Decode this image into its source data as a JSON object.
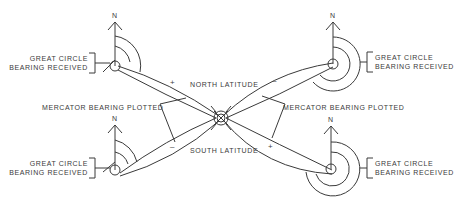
{
  "diagram": {
    "north_label": "N",
    "center_labels": {
      "north_latitude": "NORTH LATITUDE",
      "south_latitude": "SOUTH LATITUDE"
    },
    "mercator_labels": {
      "left": "MERCATOR BEARING PLOTTED",
      "right": "MERCATOR BEARING PLOTTED"
    },
    "stations": [
      {
        "position": "top-left",
        "line1": "GREAT CIRCLE",
        "line2": "BEARING RECEIVED"
      },
      {
        "position": "top-right",
        "line1": "GREAT CIRCLE",
        "line2": "BEARING RECEIVED"
      },
      {
        "position": "bottom-left",
        "line1": "GREAT CIRCLE",
        "line2": "BEARING RECEIVED"
      },
      {
        "position": "bottom-right",
        "line1": "GREAT CIRCLE",
        "line2": "BEARING RECEIVED"
      }
    ],
    "signs": {
      "top_left": "+",
      "top_right": "–",
      "bottom_left": "–",
      "bottom_right": "+"
    },
    "line_color": "#3a3a3a"
  }
}
